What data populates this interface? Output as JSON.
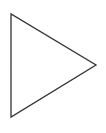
{
  "diagram": {
    "shape": "triangle",
    "orientation": "right-pointing",
    "vertices": [
      [
        11,
        14
      ],
      [
        11,
        117
      ],
      [
        96,
        65
      ]
    ],
    "stroke_color": "#333333",
    "fill_color": "#ffffff",
    "background_color": "#ffffff",
    "stroke_width": 1.3
  }
}
